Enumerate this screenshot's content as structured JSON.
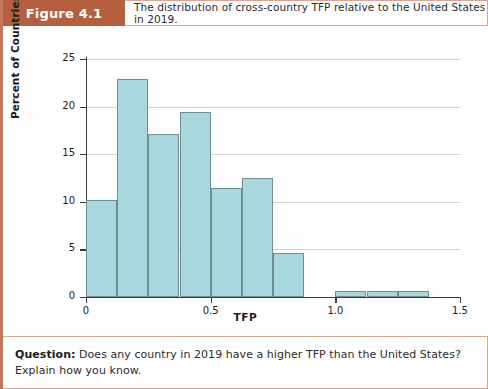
{
  "figure": {
    "tag": "Figure 4.1",
    "caption": "The distribution of cross-country TFP relative to the United States in 2019."
  },
  "footer": {
    "question_label": "Question:",
    "question_text": " Does any country in 2019 have a higher TFP than the United States? Explain how you know."
  },
  "chart_data": {
    "type": "bar",
    "title": "",
    "xlabel": "TFP",
    "ylabel": "Percent of Countries",
    "xlim": [
      0,
      1.5
    ],
    "ylim": [
      0,
      25
    ],
    "grid": true,
    "legend": "none",
    "bin_width": 0.125,
    "bin_starts": [
      0,
      0.125,
      0.25,
      0.375,
      0.5,
      0.625,
      0.75,
      0.875,
      1.0,
      1.125,
      1.25
    ],
    "categories": [
      "0-0.125",
      "0.125-0.25",
      "0.25-0.375",
      "0.375-0.5",
      "0.5-0.625",
      "0.625-0.75",
      "0.75-0.875",
      "0.875-1.0",
      "1.0-1.125",
      "1.125-1.25",
      "1.25-1.375"
    ],
    "values": [
      10.2,
      22.9,
      17.1,
      19.4,
      11.5,
      12.5,
      4.6,
      0.0,
      0.6,
      0.6,
      0.6
    ],
    "xticks": [
      0,
      0.5,
      1.0,
      1.5
    ],
    "xtick_labels": [
      "0",
      "0.5",
      "1.0",
      "1.5"
    ],
    "yticks": [
      0,
      5,
      10,
      15,
      20,
      25
    ],
    "ytick_labels": [
      "0",
      "5",
      "10",
      "15",
      "20",
      "25"
    ],
    "bar_color": "#a8d8de",
    "bar_edge_color": "#6f8e93"
  }
}
